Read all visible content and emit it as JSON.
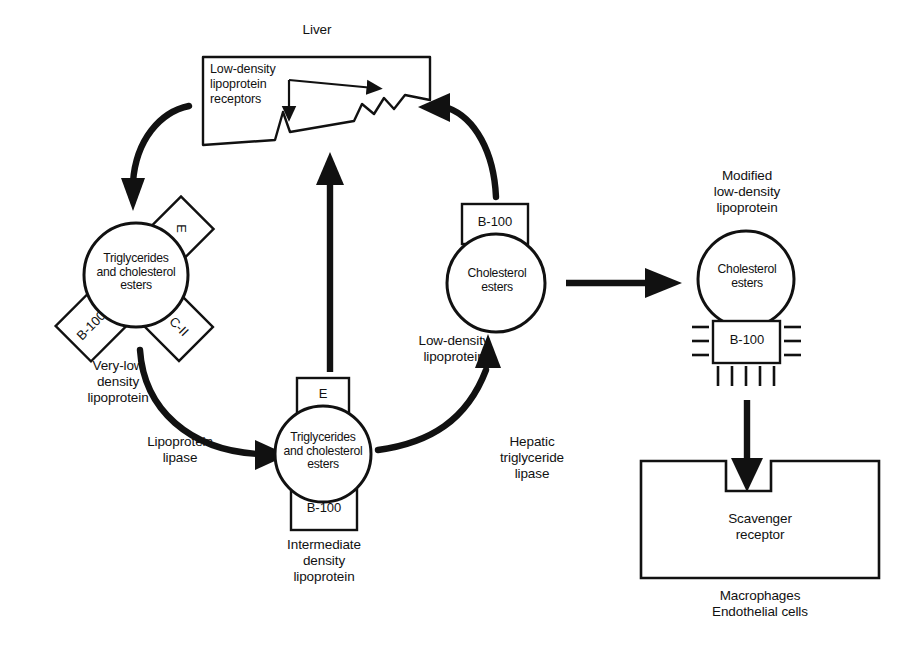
{
  "figure": {
    "title_visible": false,
    "background_color": "#ffffff",
    "line_color": "#111111"
  },
  "liver": {
    "title": "Liver",
    "receptor_label": "Low-density\nlipoprotein\nreceptors"
  },
  "vldl": {
    "core_text": "Triglycerides\nand cholesterol\nesters",
    "apo_e": "E",
    "apo_b100": "B-100",
    "apo_c2": "C-II",
    "caption": "Very-low\ndensity\nlipoprotein"
  },
  "idl": {
    "core_text": "Triglycerides\nand cholesterol\nesters",
    "apo_e": "E",
    "apo_b100": "B-100",
    "caption": "Intermediate\ndensity\nlipoprotein"
  },
  "ldl": {
    "core_text": "Cholesterol\nesters",
    "apo_b100": "B-100",
    "caption": "Low-density\nlipoprotein"
  },
  "modified_ldl": {
    "caption": "Modified\nlow-density\nlipoprotein",
    "core_text": "Cholesterol\nesters",
    "apo_b100": "B-100"
  },
  "macrophage": {
    "receptor_label": "Scavenger\nreceptor",
    "caption": "Macrophages\nEndothelial cells"
  },
  "enzymes": {
    "lipoprotein_lipase": "Lipoprotein\nlipase",
    "hepatic_triglyceride_lipase": "Hepatic\ntriglyceride\nlipase"
  }
}
